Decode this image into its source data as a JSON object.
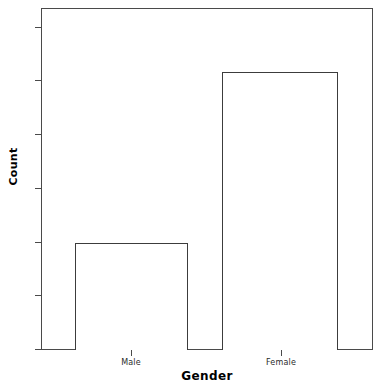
{
  "chart_data": {
    "type": "bar",
    "title": "",
    "subtitle": "",
    "categories": [
      "Male",
      "Female"
    ],
    "values": [
      10,
      26
    ],
    "xlabel": "Gender",
    "ylabel": "Count",
    "ylim": [
      0,
      32
    ],
    "yticks": [
      0,
      5,
      10,
      15,
      20,
      25,
      30
    ],
    "ytick_labels": [
      "0",
      "5",
      "10",
      "15",
      "20",
      "25",
      "30"
    ],
    "xtick_labels": [
      "Male",
      "Female"
    ],
    "grid": false,
    "legend": null,
    "bar_fill_color": "#ffffff",
    "bar_edge_color": "#3c3c3c",
    "axis_color": "#4a4a4a",
    "background_color": "#ffffff",
    "annotations": []
  },
  "axes": {
    "y_title": "Count",
    "x_title": "Gender",
    "y_tick_0": "0",
    "y_tick_1": "5",
    "y_tick_2": "10",
    "y_tick_3": "15",
    "y_tick_4": "20",
    "y_tick_5": "25",
    "y_tick_6": "30",
    "x_tick_0": "Male",
    "x_tick_1": "Female"
  }
}
